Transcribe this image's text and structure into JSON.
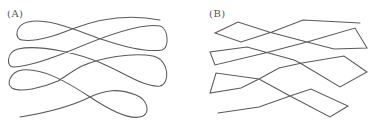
{
  "figure": {
    "panels": [
      {
        "id": "A",
        "label": "(A)",
        "description": "Smooth serpentine curve with rounded loops at the turns",
        "style": "smooth",
        "stroke_color": "#5a5a5a"
      },
      {
        "id": "B",
        "label": "(B)",
        "description": "Polyline serpentine path with sharp angular turns",
        "style": "polyline",
        "stroke_color": "#5a5a5a",
        "vertices": [
          [
            360,
            23
          ],
          [
            303,
            20
          ],
          [
            272,
            32
          ],
          [
            241,
            42
          ],
          [
            215,
            33
          ],
          [
            238,
            22
          ],
          [
            269,
            32
          ],
          [
            307,
            42
          ],
          [
            334,
            49
          ],
          [
            367,
            48
          ],
          [
            355,
            28
          ],
          [
            307,
            42
          ],
          [
            265,
            53
          ],
          [
            215,
            65
          ],
          [
            210,
            52
          ],
          [
            247,
            47
          ],
          [
            294,
            60
          ],
          [
            300,
            63
          ],
          [
            340,
            87
          ],
          [
            367,
            72
          ],
          [
            344,
            56
          ],
          [
            302,
            63
          ],
          [
            279,
            68
          ],
          [
            259,
            79
          ],
          [
            241,
            88
          ],
          [
            210,
            93
          ],
          [
            216,
            73
          ],
          [
            259,
            79
          ],
          [
            290,
            96
          ],
          [
            330,
            117
          ],
          [
            348,
            106
          ],
          [
            311,
            89
          ],
          [
            290,
            96
          ],
          [
            259,
            107
          ],
          [
            218,
            113
          ]
        ]
      }
    ]
  }
}
